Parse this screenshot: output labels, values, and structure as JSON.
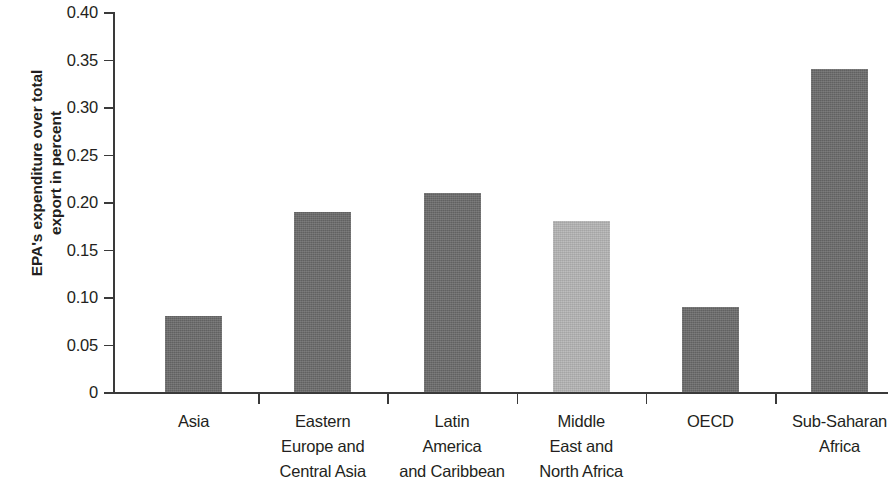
{
  "chart_data": {
    "type": "bar",
    "title": "",
    "xlabel": "",
    "ylabel": "EPA's expenditure over total\nexport in percent",
    "categories": [
      "Asia",
      "Eastern\nEurope and\nCentral Asia",
      "Latin\nAmerica\nand Caribbean",
      "Middle\nEast and\nNorth Africa",
      "OECD",
      "Sub-Saharan\nAfrica"
    ],
    "values": [
      0.08,
      0.19,
      0.21,
      0.18,
      0.09,
      0.34
    ],
    "bar_colors": [
      "#6b6b6b",
      "#6b6b6b",
      "#6b6b6b",
      "#b5b5b5",
      "#6b6b6b",
      "#6b6b6b"
    ],
    "ylim": [
      0,
      0.4
    ],
    "ytick_values": [
      0,
      0.05,
      0.1,
      0.15,
      0.2,
      0.25,
      0.3,
      0.35,
      0.4
    ],
    "ytick_labels": [
      "0",
      "0.05",
      "0.10",
      "0.15",
      "0.20",
      "0.25",
      "0.30",
      "0.35",
      "0.40"
    ],
    "grid": false,
    "legend": "none",
    "axis_color": "#3a3a3a",
    "text_color": "#231f20",
    "background": "#ffffff"
  }
}
